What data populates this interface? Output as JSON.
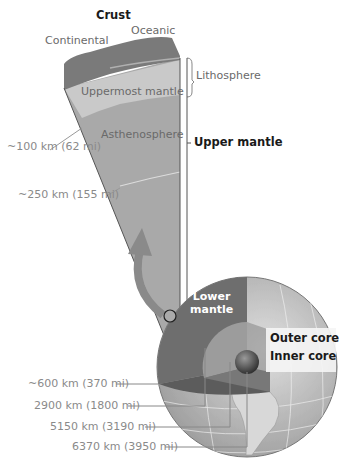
{
  "labels": {
    "crust": "Crust",
    "continental": "Continental",
    "oceanic": "Oceanic",
    "lithosphere": "Lithosphere",
    "uppermost_mantle": "Uppermost mantle",
    "asthenosphere": "Asthenosphere",
    "upper_mantle": "Upper mantle",
    "lower_mantle_1": "Lower",
    "lower_mantle_2": "mantle",
    "outer_core": "Outer core",
    "inner_core": "Inner core"
  },
  "depths": {
    "d100": "~100 km (62 mi)",
    "d250": "~250 km (155 mi)",
    "d600": "~600 km (370 mi)",
    "d2900": "2900 km (1800 mi)",
    "d5150": "5150 km (3190 mi)",
    "d6370": "6370 km (3950 mi)"
  },
  "colors": {
    "crust": "#7a7a7a",
    "uppermost_mantle": "#c8c8c8",
    "asthenosphere": "#a8a8a8",
    "lower_mantle": "#6e6e6e",
    "outer_core": "#9a9a9a",
    "inner_core": "#4a4a4a",
    "globe": "#c4c4c4"
  }
}
